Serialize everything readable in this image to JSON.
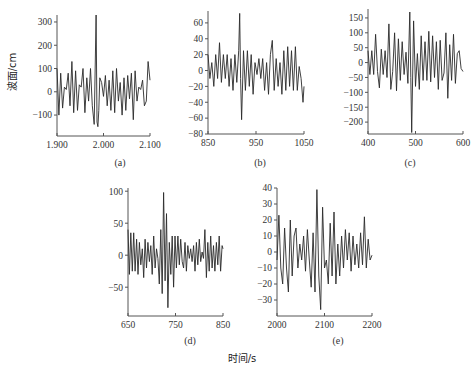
{
  "figure": {
    "ylabel": "波面/cm",
    "xlabel": "时间/s"
  },
  "chart_data": [
    {
      "id": "a",
      "type": "line",
      "panel_label": "(a)",
      "title": "",
      "xlabel": "时间/s",
      "ylabel": "波面/cm",
      "xlim": [
        1900,
        2100
      ],
      "ylim": [
        -190,
        330
      ],
      "xticks": [
        1900,
        2000,
        2100
      ],
      "xtick_labels": [
        "1.900",
        "2.000",
        "2.100"
      ],
      "yticks": [
        300,
        200,
        100,
        0,
        -100
      ],
      "ytick_labels": [
        "300",
        "200",
        "100",
        "0",
        "-100"
      ],
      "grid": false,
      "series": [
        {
          "name": "wave elevation (a)",
          "x": [
            1900,
            1904,
            1908,
            1912,
            1916,
            1920,
            1924,
            1928,
            1932,
            1936,
            1940,
            1944,
            1948,
            1952,
            1956,
            1960,
            1964,
            1968,
            1972,
            1976,
            1980,
            1984,
            1986,
            1988,
            1990,
            1992,
            1996,
            2000,
            2004,
            2008,
            2012,
            2016,
            2020,
            2024,
            2028,
            2032,
            2036,
            2040,
            2044,
            2048,
            2052,
            2056,
            2060,
            2064,
            2068,
            2072,
            2076,
            2080,
            2084,
            2088,
            2092,
            2096,
            2100
          ],
          "y": [
            100,
            -100,
            80,
            -70,
            20,
            10,
            80,
            -60,
            130,
            -90,
            90,
            -80,
            30,
            20,
            100,
            -90,
            60,
            -40,
            100,
            -60,
            -140,
            330,
            -130,
            -150,
            -80,
            60,
            40,
            -20,
            70,
            -60,
            50,
            -80,
            90,
            -90,
            100,
            -40,
            40,
            -100,
            60,
            -80,
            70,
            -30,
            80,
            -120,
            90,
            -40,
            20,
            10,
            50,
            -60,
            -40,
            130,
            50
          ]
        }
      ]
    },
    {
      "id": "b",
      "type": "line",
      "panel_label": "(b)",
      "title": "",
      "xlabel": "时间/s",
      "ylabel": "波面/cm",
      "xlim": [
        850,
        1050
      ],
      "ylim": [
        -80,
        75
      ],
      "xticks": [
        850,
        950,
        1050
      ],
      "xtick_labels": [
        "850",
        "950",
        "1050"
      ],
      "yticks": [
        60,
        40,
        20,
        0,
        -20,
        -40,
        -60,
        -80
      ],
      "ytick_labels": [
        "60",
        "40",
        "20",
        "0",
        "-20",
        "-40",
        "-60",
        "-80"
      ],
      "grid": false,
      "series": [
        {
          "name": "wave elevation (b)",
          "x": [
            850,
            854,
            858,
            862,
            866,
            870,
            874,
            878,
            882,
            886,
            890,
            894,
            898,
            902,
            906,
            910,
            914,
            916,
            918,
            920,
            924,
            928,
            932,
            936,
            940,
            944,
            948,
            952,
            956,
            960,
            964,
            968,
            972,
            976,
            980,
            984,
            988,
            992,
            996,
            1000,
            1004,
            1008,
            1012,
            1016,
            1020,
            1024,
            1028,
            1032,
            1036,
            1040,
            1044,
            1048,
            1050
          ],
          "y": [
            20,
            -10,
            10,
            -20,
            20,
            -10,
            35,
            -15,
            20,
            -10,
            20,
            -20,
            15,
            -25,
            20,
            -15,
            25,
            72,
            -10,
            -62,
            25,
            -25,
            25,
            -20,
            20,
            -30,
            10,
            -5,
            15,
            -10,
            15,
            -25,
            10,
            -30,
            20,
            38,
            -25,
            15,
            -20,
            10,
            -30,
            25,
            -25,
            30,
            -20,
            25,
            -25,
            30,
            -25,
            5,
            -10,
            -40,
            -20
          ]
        }
      ]
    },
    {
      "id": "c",
      "type": "line",
      "panel_label": "(c)",
      "title": "",
      "xlabel": "时间/s",
      "ylabel": "波面/cm",
      "xlim": [
        400,
        600
      ],
      "ylim": [
        -240,
        180
      ],
      "xticks": [
        400,
        500,
        600
      ],
      "xtick_labels": [
        "400",
        "500",
        "600"
      ],
      "yticks": [
        150,
        100,
        50,
        0,
        -50,
        -100,
        -150,
        -200
      ],
      "ytick_labels": [
        "150",
        "100",
        "50",
        "0",
        "-50",
        "-100",
        "-150",
        "-200"
      ],
      "grid": false,
      "series": [
        {
          "name": "wave elevation (c)",
          "x": [
            400,
            404,
            408,
            412,
            416,
            420,
            424,
            428,
            432,
            436,
            440,
            444,
            448,
            452,
            456,
            460,
            464,
            468,
            472,
            476,
            480,
            484,
            488,
            490,
            492,
            496,
            500,
            504,
            508,
            512,
            516,
            520,
            524,
            528,
            532,
            536,
            540,
            544,
            548,
            552,
            556,
            560,
            564,
            568,
            572,
            576,
            580,
            584,
            588,
            592,
            596,
            600
          ],
          "y": [
            40,
            -40,
            40,
            -40,
            95,
            -30,
            -85,
            45,
            -40,
            40,
            -50,
            130,
            -90,
            -30,
            100,
            -95,
            80,
            -60,
            70,
            -40,
            35,
            -70,
            170,
            -50,
            -235,
            140,
            -80,
            30,
            -90,
            90,
            -60,
            70,
            -60,
            105,
            -65,
            90,
            -50,
            70,
            -90,
            75,
            -60,
            -35,
            100,
            -120,
            60,
            -60,
            95,
            -70,
            30,
            40,
            -20,
            -30
          ]
        }
      ]
    },
    {
      "id": "d",
      "type": "line",
      "panel_label": "(d)",
      "title": "",
      "xlabel": "时间/s",
      "ylabel": "波面/cm",
      "xlim": [
        650,
        850
      ],
      "ylim": [
        -95,
        105
      ],
      "xticks": [
        650,
        750,
        850
      ],
      "xtick_labels": [
        "650",
        "750",
        "850"
      ],
      "yticks": [
        100,
        50,
        0,
        -50
      ],
      "ytick_labels": [
        "100",
        "50",
        "0",
        "-50"
      ],
      "grid": false,
      "series": [
        {
          "name": "wave elevation (d)",
          "x": [
            650,
            653,
            656,
            659,
            662,
            665,
            668,
            671,
            674,
            677,
            680,
            683,
            686,
            689,
            692,
            695,
            698,
            701,
            704,
            707,
            710,
            713,
            716,
            719,
            722,
            725,
            728,
            731,
            734,
            737,
            740,
            743,
            746,
            749,
            752,
            755,
            758,
            761,
            764,
            767,
            770,
            773,
            776,
            779,
            782,
            785,
            788,
            791,
            794,
            797,
            800,
            803,
            806,
            809,
            812,
            815,
            818,
            821,
            824,
            827,
            830,
            833,
            836,
            839,
            842,
            845,
            848,
            850
          ],
          "y": [
            40,
            -30,
            35,
            -25,
            35,
            -25,
            25,
            -30,
            20,
            -15,
            10,
            -35,
            25,
            -20,
            20,
            -10,
            15,
            -30,
            30,
            -20,
            10,
            -5,
            -45,
            40,
            -60,
            98,
            -40,
            65,
            -82,
            20,
            -30,
            30,
            -50,
            30,
            -20,
            30,
            -15,
            25,
            -10,
            -20,
            20,
            -25,
            15,
            -5,
            10,
            -10,
            15,
            -25,
            20,
            -15,
            25,
            -10,
            5,
            -5,
            40,
            -35,
            20,
            -25,
            30,
            -20,
            15,
            -25,
            20,
            -15,
            30,
            -25,
            15,
            10
          ]
        }
      ]
    },
    {
      "id": "e",
      "type": "line",
      "panel_label": "(e)",
      "title": "",
      "xlabel": "时间/s",
      "ylabel": "波面/cm",
      "xlim": [
        2000,
        2200
      ],
      "ylim": [
        -40,
        40
      ],
      "xticks": [
        2000,
        2100,
        2200
      ],
      "xtick_labels": [
        "2000",
        "2100",
        "2200"
      ],
      "yticks": [
        40,
        30,
        20,
        10,
        0,
        -10,
        -20,
        -30
      ],
      "ytick_labels": [
        "40",
        "30",
        "20",
        "10",
        "0",
        "-10",
        "-20",
        "-30"
      ],
      "grid": false,
      "series": [
        {
          "name": "wave elevation (e)",
          "x": [
            2000,
            2004,
            2008,
            2012,
            2016,
            2020,
            2024,
            2028,
            2032,
            2036,
            2040,
            2044,
            2048,
            2052,
            2056,
            2060,
            2064,
            2068,
            2072,
            2076,
            2080,
            2084,
            2088,
            2092,
            2096,
            2100,
            2104,
            2108,
            2112,
            2116,
            2120,
            2124,
            2128,
            2132,
            2136,
            2140,
            2144,
            2148,
            2152,
            2156,
            2160,
            2164,
            2168,
            2172,
            2176,
            2180,
            2184,
            2188,
            2192,
            2196,
            2200
          ],
          "y": [
            -5,
            23,
            -10,
            -20,
            15,
            -10,
            -25,
            20,
            -15,
            10,
            15,
            -10,
            5,
            -5,
            10,
            -12,
            14,
            -5,
            -22,
            12,
            -25,
            39,
            -15,
            -36,
            28,
            -10,
            -5,
            -20,
            18,
            -15,
            25,
            -20,
            5,
            -15,
            10,
            -10,
            14,
            -5,
            12,
            -12,
            10,
            -8,
            5,
            -10,
            12,
            -8,
            22,
            -10,
            8,
            -5,
            -2
          ]
        }
      ]
    }
  ]
}
